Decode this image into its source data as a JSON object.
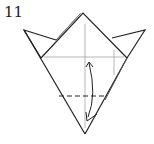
{
  "diagram": {
    "step_number": "11",
    "colors": {
      "line": "#222222",
      "crease": "#999999",
      "background": "#ffffff"
    }
  }
}
